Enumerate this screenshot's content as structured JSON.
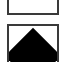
{
  "tiles": [
    {
      "id": "tile-top",
      "icon": "dots-icon",
      "state": "unselected",
      "border_color": "#3a3a3a",
      "glyph_color": "#8a8a8a"
    },
    {
      "id": "tile-bottom",
      "icon": "diamond-icon",
      "state": "selected",
      "border_color": "#3a3a3a",
      "glyph_color": "#000000"
    }
  ]
}
